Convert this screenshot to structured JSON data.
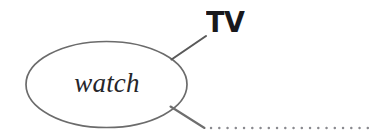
{
  "diagram": {
    "type": "mind-map",
    "background_color": "#ffffff",
    "stroke_color": "#6b6b6b",
    "central_node": {
      "label": "watch",
      "shape": "ellipse",
      "text_color": "#26262a",
      "cx": 106.5,
      "cy": 84.5,
      "rx": 81,
      "ry": 43.5
    },
    "branches": [
      {
        "id": "branch-tv",
        "label": "TV",
        "text_color": "#19191c",
        "line_style": "solid",
        "from": {
          "x": 172,
          "y": 59
        },
        "to": {
          "x": 206,
          "y": 36
        }
      },
      {
        "id": "branch-empty",
        "label": "",
        "line_style": "solid-then-dotted",
        "from": {
          "x": 171,
          "y": 107
        },
        "to": {
          "x": 204,
          "y": 128
        },
        "dotted_from": {
          "x": 210,
          "y": 128
        },
        "dotted_to": {
          "x": 373,
          "y": 128
        },
        "dot_color": "#8a8a8f"
      }
    ]
  }
}
